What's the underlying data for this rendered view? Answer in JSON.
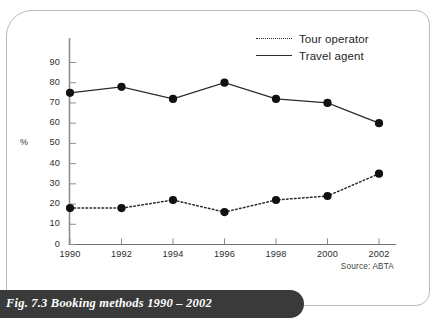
{
  "figure": {
    "caption": "Fig. 7.3 Booking methods 1990 – 2002",
    "source_note": "Source: ABTA",
    "caption_bar_color": "#3a3a3a",
    "card_border_color": "#b9b9b9"
  },
  "legend": {
    "position": "top-right",
    "entries": [
      {
        "label": "Tour operator",
        "style": "dotted",
        "icon": "dotted-line-swatch"
      },
      {
        "label": "Travel agent",
        "style": "solid",
        "icon": "solid-line-swatch"
      }
    ]
  },
  "chart_data": {
    "type": "line",
    "title": "Fig. 7.3 Booking methods 1990 – 2002",
    "xlabel": "",
    "ylabel": "%",
    "x": [
      1990,
      1992,
      1994,
      1996,
      1998,
      2000,
      2002
    ],
    "xtick_labels": [
      "1990",
      "1992",
      "1994",
      "1996",
      "1998",
      "2000",
      "2002"
    ],
    "ytick_labels": [
      "0",
      "10",
      "20",
      "30",
      "40",
      "50",
      "60",
      "70",
      "80",
      "90"
    ],
    "yticks": [
      0,
      10,
      20,
      30,
      40,
      50,
      60,
      70,
      80,
      90
    ],
    "ylim": [
      0,
      95
    ],
    "grid": false,
    "legend_position": "top-right",
    "marker": "filled-circle",
    "marker_color": "#111111",
    "line_color": "#2b2b2b",
    "series": [
      {
        "name": "Tour operator",
        "style": "dotted",
        "values": [
          18,
          18,
          22,
          16,
          22,
          24,
          35
        ]
      },
      {
        "name": "Travel agent",
        "style": "solid",
        "values": [
          75,
          78,
          72,
          80,
          72,
          70,
          60
        ]
      }
    ],
    "annotations": [
      "Source: ABTA"
    ]
  }
}
